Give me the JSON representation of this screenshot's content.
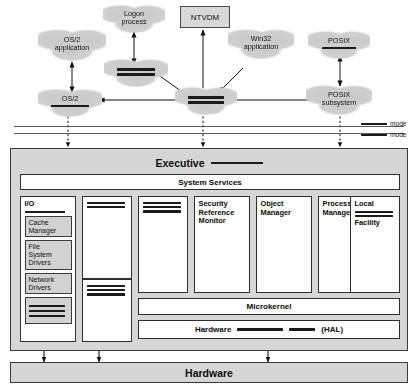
{
  "figure": {
    "redaction_note": "Several labels in the scanned figure are obscured by solid black bars."
  },
  "user_mode": {
    "clouds": [
      {
        "id": "os2-application",
        "lines": [
          "OS/2",
          "application"
        ],
        "redacted_lines": 0
      },
      {
        "id": "os2-subsystem",
        "lines": [
          "OS/2"
        ],
        "redacted_lines": 1
      },
      {
        "id": "logon-process",
        "lines": [
          "Logon",
          "process"
        ],
        "redacted_lines": 0
      },
      {
        "id": "security-subsystem",
        "lines": [],
        "redacted_lines": 2
      },
      {
        "id": "win32-subsystem",
        "lines": [],
        "redacted_lines": 2
      },
      {
        "id": "win32-application",
        "lines": [
          "Win32",
          "application"
        ],
        "redacted_lines": 0
      },
      {
        "id": "posix-application",
        "lines": [
          "POSIX"
        ],
        "redacted_lines": 1
      },
      {
        "id": "posix-subsystem",
        "lines": [
          "POSIX",
          "subsystem"
        ],
        "redacted_lines": 0
      }
    ],
    "ntvdm": {
      "label": "NTVDM"
    }
  },
  "mode_divider": {
    "upper": {
      "redacted": true,
      "label": "mode"
    },
    "lower": {
      "redacted": true,
      "label": "mode"
    }
  },
  "executive": {
    "title": "Executive",
    "title_redacted": true,
    "system_services": "System Services",
    "columns": [
      {
        "id": "io-manager",
        "heading": "I/O",
        "heading_redacted_lines": 1,
        "boxes": [
          {
            "label": "Cache\nManager",
            "redacted": false
          },
          {
            "label": "File\nSystem\nDrivers",
            "redacted": false
          },
          {
            "label": "Network\nDrivers",
            "redacted": false
          },
          {
            "label": "",
            "redacted": true,
            "redacted_lines": 3
          }
        ]
      },
      {
        "id": "column-2",
        "heading": "",
        "heading_redacted_lines": 2,
        "boxes": [],
        "lower_block_redacted_lines": 3
      },
      {
        "id": "column-3",
        "heading": "",
        "heading_redacted_lines": 3,
        "boxes": []
      },
      {
        "id": "security-reference-monitor",
        "heading": "Security\nReference\nMonitor",
        "heading_redacted_lines": 0,
        "boxes": []
      },
      {
        "id": "object-manager",
        "heading": "Object\nManager",
        "heading_redacted_lines": 0,
        "boxes": []
      },
      {
        "id": "process-manager",
        "heading": "Process\nManager",
        "heading_redacted_lines": 0,
        "boxes": []
      },
      {
        "id": "local-procedure-call-facility",
        "heading_line1": "Local",
        "heading_redacted_lines": 2,
        "heading_line2": "Facility"
      }
    ],
    "microkernel": "Microkernel",
    "hal": {
      "prefix": "Hardware",
      "suffix": "(HAL)",
      "redacted_segments": 2
    }
  },
  "hardware": {
    "label": "Hardware"
  },
  "colors": {
    "panel_fill": "#d6d6d6",
    "box_fill": "#fdfdfd",
    "subbox_fill": "#d2d2d2",
    "cloud_fill": "#cfcfcf",
    "redaction": "#1b1b1b",
    "stroke": "#2e2e2e"
  }
}
